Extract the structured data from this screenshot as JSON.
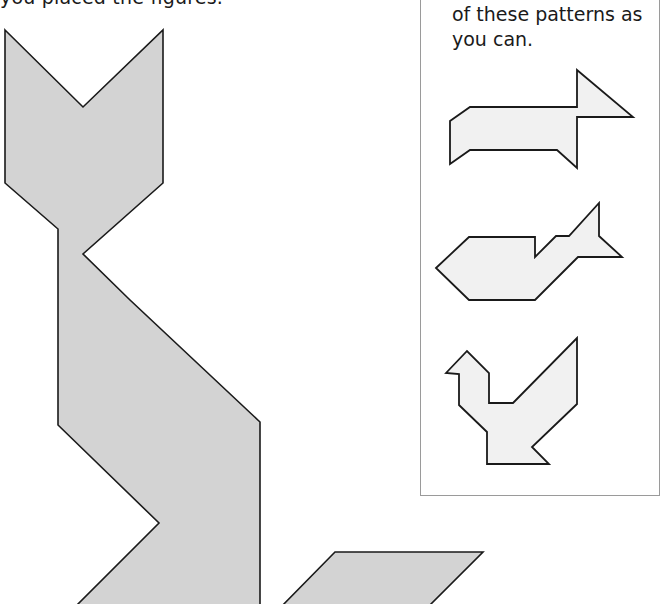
{
  "page": {
    "top_text": "you placed the figures.",
    "panel": {
      "text_lines": [
        "of these patterns as",
        "you can."
      ],
      "patterns": [
        {
          "name": "dog",
          "label": "dog-pattern"
        },
        {
          "name": "fish",
          "label": "fish-pattern"
        },
        {
          "name": "bird",
          "label": "bird-pattern"
        }
      ]
    },
    "main_figure": {
      "name": "cat",
      "label": "cat-tangram-figure"
    }
  },
  "colors": {
    "main_fill": "#d3d3d3",
    "pattern_fill": "#f1f1f1",
    "outline": "#1a1a1a",
    "panel_border": "#9a9a9a",
    "text": "#1a1a1a"
  }
}
